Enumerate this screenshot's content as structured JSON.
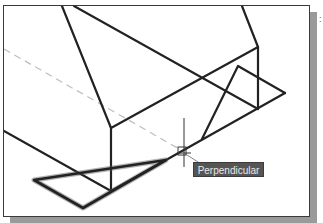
{
  "viewport": {
    "background": "#ffffff",
    "frame_color": "#3a3a3a",
    "shadow_color": "#9a9a9a"
  },
  "drawing": {
    "line_color": "#222222",
    "dashed_line_color": "#bdbdbd",
    "cursor_color": "#333333"
  },
  "osnap_tooltip": {
    "label": "Perpendicular",
    "background": "#555555",
    "text_color": "#e8e8e8"
  },
  "edge_fragment": {
    "text": ":"
  }
}
